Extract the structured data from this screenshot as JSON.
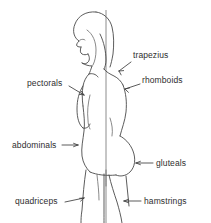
{
  "diagram": {
    "background_color": "#ffffff",
    "line_color": "#4a4a4a",
    "text_color": "#2e2e2e",
    "plumb_line_color": "#6e6e6e",
    "labels": [
      {
        "id": "trapezius",
        "text": "trapezius",
        "side": "right",
        "text_x": 133,
        "text_y": 55,
        "leader": {
          "from_x": 131,
          "from_y": 63,
          "to_x": 117,
          "to_y": 72
        },
        "arrow": "down-left"
      },
      {
        "id": "rhomboids",
        "text": "rhomboids",
        "side": "right",
        "text_x": 141,
        "text_y": 80,
        "leader": {
          "from_x": 139,
          "from_y": 85,
          "to_x": 123,
          "to_y": 90
        },
        "arrow": "down-left"
      },
      {
        "id": "pectorals",
        "text": "pectorals",
        "side": "left",
        "text_x": 28,
        "text_y": 82,
        "leader": {
          "from_x": 68,
          "from_y": 86,
          "to_x": 85,
          "to_y": 95
        },
        "arrow": "down-right"
      },
      {
        "id": "abdominals",
        "text": "abdominals",
        "side": "left",
        "text_x": 13,
        "text_y": 140,
        "leader": {
          "from_x": 63,
          "from_y": 145,
          "to_x": 78,
          "to_y": 145
        },
        "arrow": "right"
      },
      {
        "id": "gluteals",
        "text": "gluteals",
        "side": "right",
        "text_x": 155,
        "text_y": 159,
        "leader": {
          "from_x": 153,
          "from_y": 163,
          "to_x": 135,
          "to_y": 163
        },
        "arrow": "left"
      },
      {
        "id": "quadriceps",
        "text": "quadriceps",
        "side": "left",
        "text_x": 16,
        "text_y": 197,
        "leader": {
          "from_x": 65,
          "from_y": 202,
          "to_x": 84,
          "to_y": 198
        },
        "arrow": "up-right"
      },
      {
        "id": "hamstrings",
        "text": "hamstrings",
        "side": "right",
        "text_x": 143,
        "text_y": 197,
        "leader": {
          "from_x": 141,
          "from_y": 201,
          "to_x": 126,
          "to_y": 201
        },
        "arrow": "left"
      }
    ]
  }
}
